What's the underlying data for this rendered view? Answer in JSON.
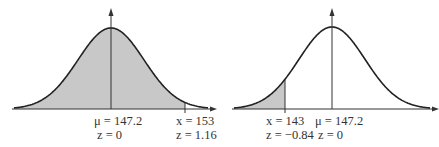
{
  "chart_data": [
    {
      "type": "area",
      "title": "",
      "description": "Normal curve, shaded area to the left of x = 153",
      "mean": 147.2,
      "shade": "left",
      "shade_bound": 153,
      "annotations": [
        {
          "var": "μ",
          "value": "147.2",
          "z": "0"
        },
        {
          "var": "x",
          "value": "153",
          "z": "1.16"
        }
      ]
    },
    {
      "type": "area",
      "title": "",
      "description": "Normal curve, shaded area to the left of x = 143",
      "mean": 147.2,
      "shade": "left",
      "shade_bound": 143,
      "annotations": [
        {
          "var": "x",
          "value": "143",
          "z": "−0.84"
        },
        {
          "var": "μ",
          "value": "147.2",
          "z": "0"
        }
      ]
    }
  ],
  "colors": {
    "shade": "#c8c8c8",
    "curve": "#222222"
  },
  "labels": {
    "left_mu": "μ = 147.2",
    "left_mu_z": "z = 0",
    "left_x": "x = 153",
    "left_x_z": "z = 1.16",
    "right_x": "x = 143",
    "right_x_z": "z = −0.84",
    "right_mu": "μ = 147.2",
    "right_mu_z": "z = 0"
  }
}
